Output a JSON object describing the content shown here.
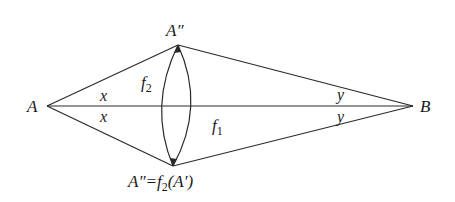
{
  "diagram": {
    "points": {
      "A": {
        "label": "A",
        "x": 47,
        "y": 106
      },
      "B": {
        "label": "B",
        "x": 413,
        "y": 106
      },
      "top": {
        "label": "A″",
        "x": 178,
        "y": 45
      },
      "bottom": {
        "label": "A″=f₂(A′)",
        "x": 173,
        "y": 166
      }
    },
    "labels": {
      "A": "A",
      "B": "B",
      "top_vertex": "A″",
      "bottom_vertex_prefix": "A″=",
      "bottom_vertex_f": "f",
      "bottom_vertex_sub": "2",
      "bottom_vertex_arg": "(A′)",
      "f2_main": "f",
      "f2_sub": "2",
      "f1_main": "f",
      "f1_sub": "1",
      "angle_x_upper": "x",
      "angle_x_lower": "x",
      "angle_y_upper": "y",
      "angle_y_lower": "y"
    },
    "edges": [
      {
        "from": "A",
        "to": "top"
      },
      {
        "from": "A",
        "to": "bottom"
      },
      {
        "from": "A",
        "to": "B"
      },
      {
        "from": "top",
        "to": "B"
      },
      {
        "from": "bottom",
        "to": "B"
      }
    ],
    "arcs": [
      {
        "name": "f2-arc-left",
        "description": "left arc from top vertex to bottom vertex"
      },
      {
        "name": "f2-arc-right",
        "description": "right arc from top vertex to bottom vertex"
      }
    ],
    "colors": {
      "line": "#2a2a2a",
      "text": "#1a1a1a",
      "background": "#ffffff"
    }
  }
}
